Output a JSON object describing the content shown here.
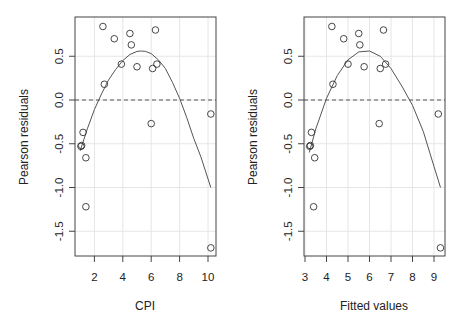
{
  "chart_data": [
    {
      "type": "scatter",
      "panel": "left",
      "title": "",
      "xlabel": "CPI",
      "ylabel": "Pearson residuals",
      "xlim": [
        0.6,
        10.5
      ],
      "ylim": [
        -1.8,
        0.9
      ],
      "xticks": [
        2,
        4,
        6,
        8,
        10
      ],
      "xtick_labels": [
        "2",
        "4",
        "6",
        "8",
        "10"
      ],
      "yticks": [
        0.5,
        0.0,
        -0.5,
        -1.0,
        -1.5
      ],
      "ytick_labels": [
        "0.5",
        "0.0",
        "-0.5",
        "-1.0",
        "-1.5"
      ],
      "grid": true,
      "reference_line": {
        "y": 0.0,
        "style": "dashed"
      },
      "points": [
        {
          "x": 2.6,
          "y": 0.84
        },
        {
          "x": 3.4,
          "y": 0.7
        },
        {
          "x": 4.5,
          "y": 0.76
        },
        {
          "x": 4.6,
          "y": 0.63
        },
        {
          "x": 3.9,
          "y": 0.41
        },
        {
          "x": 5.0,
          "y": 0.38
        },
        {
          "x": 2.7,
          "y": 0.18
        },
        {
          "x": 6.3,
          "y": 0.8
        },
        {
          "x": 6.1,
          "y": 0.36
        },
        {
          "x": 6.4,
          "y": 0.41
        },
        {
          "x": 6.0,
          "y": -0.27
        },
        {
          "x": 10.2,
          "y": -0.16
        },
        {
          "x": 1.2,
          "y": -0.37
        },
        {
          "x": 1.1,
          "y": -0.52
        },
        {
          "x": 1.05,
          "y": -0.53
        },
        {
          "x": 1.4,
          "y": -0.66
        },
        {
          "x": 1.4,
          "y": -1.22
        },
        {
          "x": 10.2,
          "y": -1.69
        }
      ],
      "smooth_curve": {
        "x": [
          1.0,
          1.5,
          2.0,
          2.5,
          3.0,
          3.5,
          4.0,
          4.5,
          5.0,
          5.3,
          5.6,
          6.0,
          6.5,
          7.0,
          7.5,
          8.0,
          8.5,
          9.0,
          9.5,
          10.2
        ],
        "y": [
          -0.58,
          -0.33,
          -0.11,
          0.07,
          0.23,
          0.35,
          0.45,
          0.52,
          0.555,
          0.56,
          0.555,
          0.53,
          0.46,
          0.36,
          0.2,
          0.02,
          -0.2,
          -0.44,
          -0.65,
          -1.0
        ]
      }
    },
    {
      "type": "scatter",
      "panel": "right",
      "title": "",
      "xlabel": "Fitted values",
      "ylabel": "Pearson residuals",
      "xlim": [
        2.9,
        9.5
      ],
      "ylim": [
        -1.8,
        0.9
      ],
      "xticks": [
        3,
        4,
        5,
        6,
        7,
        8,
        9
      ],
      "xtick_labels": [
        "3",
        "4",
        "5",
        "6",
        "7",
        "8",
        "9"
      ],
      "yticks": [
        0.5,
        0.0,
        -0.5,
        -1.0,
        -1.5
      ],
      "ytick_labels": [
        "0.5",
        "0.0",
        "-0.5",
        "-1.0",
        "-1.5"
      ],
      "grid": true,
      "reference_line": {
        "y": 0.0,
        "style": "dashed"
      },
      "points": [
        {
          "x": 4.25,
          "y": 0.84
        },
        {
          "x": 4.8,
          "y": 0.7
        },
        {
          "x": 5.5,
          "y": 0.76
        },
        {
          "x": 5.55,
          "y": 0.63
        },
        {
          "x": 5.0,
          "y": 0.41
        },
        {
          "x": 5.75,
          "y": 0.38
        },
        {
          "x": 4.3,
          "y": 0.18
        },
        {
          "x": 6.65,
          "y": 0.8
        },
        {
          "x": 6.5,
          "y": 0.36
        },
        {
          "x": 6.75,
          "y": 0.41
        },
        {
          "x": 6.45,
          "y": -0.27
        },
        {
          "x": 9.2,
          "y": -0.16
        },
        {
          "x": 3.3,
          "y": -0.37
        },
        {
          "x": 3.25,
          "y": -0.52
        },
        {
          "x": 3.22,
          "y": -0.53
        },
        {
          "x": 3.45,
          "y": -0.66
        },
        {
          "x": 3.4,
          "y": -1.22
        },
        {
          "x": 9.3,
          "y": -1.69
        }
      ],
      "smooth_curve": {
        "x": [
          3.2,
          3.5,
          4.0,
          4.5,
          5.0,
          5.5,
          6.0,
          6.5,
          7.0,
          7.5,
          8.0,
          8.5,
          9.0,
          9.3
        ],
        "y": [
          -0.6,
          -0.33,
          0.02,
          0.28,
          0.46,
          0.55,
          0.56,
          0.5,
          0.36,
          0.16,
          -0.06,
          -0.36,
          -0.76,
          -1.0
        ]
      }
    }
  ],
  "panels": [
    {
      "xlabel": "CPI",
      "ylabel": "Pearson residuals"
    },
    {
      "xlabel": "Fitted values",
      "ylabel": "Pearson residuals"
    }
  ]
}
